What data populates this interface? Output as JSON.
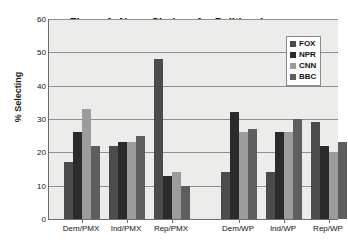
{
  "chart_data": {
    "type": "bar",
    "title": "Figure 1:  News Choices for Politics, Iraq",
    "xlabel": "",
    "ylabel": "% Selecting",
    "ylim": [
      0,
      60
    ],
    "ytick_step": 10,
    "yticks": [
      0,
      10,
      20,
      30,
      40,
      50,
      60
    ],
    "grid": true,
    "legend_position": "top-right",
    "categories": [
      "Dem/PMX",
      "Ind/PMX",
      "Rep/PMX",
      "Dem/WP",
      "Ind/WP",
      "Rep/WP"
    ],
    "series": [
      {
        "name": "FOX",
        "color": "#4c4c4c",
        "values": [
          17,
          22,
          48,
          14,
          14,
          29
        ]
      },
      {
        "name": "NPR",
        "color": "#2b2b2b",
        "values": [
          26,
          23,
          13,
          32,
          26,
          22
        ]
      },
      {
        "name": "CNN",
        "color": "#9c9c9c",
        "values": [
          33,
          23,
          14,
          26,
          26,
          20
        ]
      },
      {
        "name": "BBC",
        "color": "#5e5e5e",
        "values": [
          22,
          25,
          10,
          27,
          30,
          23
        ]
      }
    ]
  },
  "legend": {
    "items": [
      {
        "label": "FOX"
      },
      {
        "label": "NPR"
      },
      {
        "label": "CNN"
      },
      {
        "label": "BBC"
      }
    ]
  }
}
